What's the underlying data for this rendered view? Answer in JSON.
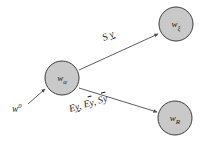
{
  "figure": {
    "background_color": "#ffffff",
    "node_fill": "#c9c9c9",
    "node_stroke": "#3c3c3c",
    "edge_color": "#4a4a4a",
    "text_color": "#1a1a1a"
  },
  "nodes": [
    {
      "id": "node-w-alpha",
      "base": "w",
      "subscript": "α",
      "superscript": "",
      "cx": 62,
      "cy": 78,
      "r": 17
    },
    {
      "id": "node-w-xi",
      "base": "w",
      "subscript": "ξ",
      "superscript": "",
      "cx": 176,
      "cy": 24,
      "r": 17
    },
    {
      "id": "node-w-r",
      "base": "w",
      "subscript": "R",
      "superscript": "",
      "cx": 175,
      "cy": 118,
      "r": 17
    }
  ],
  "edges": [
    {
      "id": "edge-input",
      "from": "w0-source",
      "to": "node-w-alpha",
      "x1": 28,
      "y1": 104,
      "x2": 45,
      "y2": 89
    },
    {
      "id": "edge-alpha-to-xi",
      "from": "node-w-alpha",
      "to": "node-w-xi",
      "x1": 79,
      "y1": 70,
      "x2": 158,
      "y2": 34
    },
    {
      "id": "edge-alpha-to-r",
      "from": "node-w-alpha",
      "to": "node-w-r",
      "x1": 79,
      "y1": 88,
      "x2": 157,
      "y2": 112
    }
  ],
  "edge_labels": {
    "top": {
      "id": "label-S-y-under",
      "text": "S y",
      "parts": [
        {
          "text": "S",
          "decoration": "none"
        },
        {
          "text": "y",
          "decoration": "underline"
        }
      ],
      "x": 104,
      "y": 41
    },
    "bottom": {
      "id": "label-Ey-Ey-Sy",
      "text": "E y, Eȳ, Sȳ",
      "parts": [
        {
          "text": "E",
          "decoration": "none"
        },
        {
          "text": "y",
          "decoration": "underline"
        },
        {
          "text": ",",
          "decoration": "none"
        },
        {
          "text": "E",
          "decoration": "none"
        },
        {
          "text": "y",
          "decoration": "overline"
        },
        {
          "text": ",",
          "decoration": "none"
        },
        {
          "text": "S",
          "decoration": "none"
        },
        {
          "text": "y",
          "decoration": "overline"
        }
      ],
      "x": 70,
      "y": 110
    }
  },
  "external_labels": [
    {
      "id": "label-w0",
      "base": "w",
      "superscript": "0",
      "x": 12,
      "y": 112
    }
  ]
}
